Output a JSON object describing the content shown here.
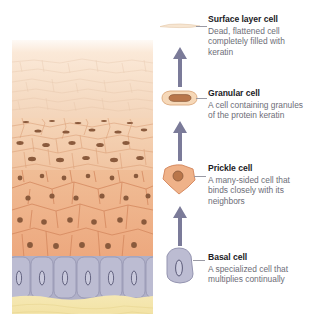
{
  "figure": {
    "illustration_name": "epidermis-cross-section"
  },
  "colors": {
    "surface_layer": "#f6e3cf",
    "granular_layer": "#f2c9a8",
    "prickle_layer": "#eeaa80",
    "basal_layer": "#b0b0c8",
    "dermis": "#f2e3ad",
    "nucleus": "#8a5a3c",
    "arrow": "#7b7b99",
    "heading_text": "#1b1b25",
    "body_text": "#6d6d77",
    "leader_line": "#9a9aa4"
  },
  "legend": {
    "entries": [
      {
        "icon": "surface-layer-cell-icon",
        "title": "Surface layer cell",
        "description": "Dead, flattened cell completely filled with keratin"
      },
      {
        "icon": "granular-cell-icon",
        "title": "Granular cell",
        "description": "A cell containing granules of the protein keratin"
      },
      {
        "icon": "prickle-cell-icon",
        "title": "Prickle cell",
        "description": "A many-sided cell that binds closely with its neighbors"
      },
      {
        "icon": "basal-cell-icon",
        "title": "Basal cell",
        "description": "A specialized cell that multiplies continually"
      }
    ],
    "arrows": [
      {
        "name": "arrow-up-surface",
        "direction": "up"
      },
      {
        "name": "arrow-up-granular",
        "direction": "up"
      },
      {
        "name": "arrow-up-prickle",
        "direction": "up"
      }
    ]
  }
}
